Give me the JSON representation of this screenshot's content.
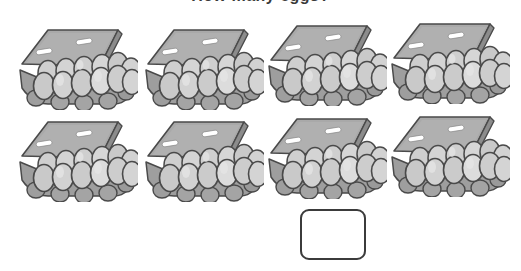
{
  "heading": {
    "text": "How many eggs?",
    "visible_fragment": "partially cropped at top edge"
  },
  "worksheet": {
    "title": "Egg carton counting worksheet",
    "carton_count": 8,
    "eggs_per_carton": 12,
    "total_eggs": 96,
    "rows": 2,
    "columns": 4,
    "cartons": [
      {
        "id": "carton-1",
        "row": 1,
        "col": 1,
        "x": 14,
        "y": 18,
        "eggs": 12,
        "label": "dozen eggs"
      },
      {
        "id": "carton-2",
        "row": 1,
        "col": 2,
        "x": 140,
        "y": 18,
        "eggs": 12,
        "label": "dozen eggs"
      },
      {
        "id": "carton-3",
        "row": 1,
        "col": 3,
        "x": 263,
        "y": 14,
        "eggs": 12,
        "label": "dozen eggs"
      },
      {
        "id": "carton-4",
        "row": 1,
        "col": 4,
        "x": 386,
        "y": 12,
        "eggs": 12,
        "label": "dozen eggs"
      },
      {
        "id": "carton-5",
        "row": 2,
        "col": 1,
        "x": 14,
        "y": 110,
        "eggs": 12,
        "label": "dozen eggs"
      },
      {
        "id": "carton-6",
        "row": 2,
        "col": 2,
        "x": 140,
        "y": 110,
        "eggs": 12,
        "label": "dozen eggs"
      },
      {
        "id": "carton-7",
        "row": 2,
        "col": 3,
        "x": 263,
        "y": 107,
        "eggs": 12,
        "label": "dozen eggs"
      },
      {
        "id": "carton-8",
        "row": 2,
        "col": 4,
        "x": 386,
        "y": 105,
        "eggs": 12,
        "label": "dozen eggs"
      }
    ]
  },
  "answer": {
    "value": "",
    "placeholder": "",
    "label": "answer box"
  },
  "colors": {
    "outline": "#4a4a4a",
    "lid_top": "#a9a9a9",
    "lid_face": "#9a9a9a",
    "lid_edge": "#8c8c8c",
    "tray": "#a2a2a2",
    "tray_shadow": "#8f8f8f",
    "egg_light": "#d8d8d8",
    "egg_mid": "#c4c4c4",
    "egg_shadow": "#aeaeae",
    "highlight": "#ffffff",
    "box_border": "#3b3b3b",
    "page_background": "#ffffff"
  }
}
